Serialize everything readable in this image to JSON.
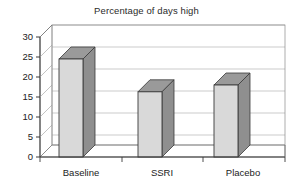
{
  "chart_data": {
    "type": "bar",
    "title": "Percentage of days high",
    "subtitle": "",
    "xlabel": "",
    "ylabel": "",
    "categories": [
      "Baseline",
      "SSRI",
      "Placebo"
    ],
    "values": [
      24.5,
      16.3,
      18.0
    ],
    "ylim": [
      0,
      30
    ],
    "ytick_labels": [
      "0",
      "5",
      "10",
      "15",
      "20",
      "25",
      "30"
    ],
    "ytick_values": [
      0,
      5,
      10,
      15,
      20,
      25,
      30
    ],
    "grid": "horizontal",
    "legend": "none",
    "style": "3d-column",
    "colors": {
      "bar_front": "#d9d9d9",
      "bar_side": "#8f8f8f",
      "bar_top": "#9a9a9a",
      "bar_outline": "#3a3a3a",
      "gridline": "#b5b5b5",
      "axis": "#3a3a3a",
      "plot_background": "#ffffff",
      "page_background": "#ffffff",
      "text": "#222222"
    }
  },
  "axis": {
    "y_ticks": [
      {
        "label": "30",
        "value": 30
      },
      {
        "label": "25",
        "value": 25
      },
      {
        "label": "20",
        "value": 20
      },
      {
        "label": "15",
        "value": 15
      },
      {
        "label": "10",
        "value": 10
      },
      {
        "label": "5",
        "value": 5
      },
      {
        "label": "0",
        "value": 0
      }
    ],
    "x_categories": [
      {
        "label": "Baseline"
      },
      {
        "label": "SSRI"
      },
      {
        "label": "Placebo"
      }
    ]
  }
}
